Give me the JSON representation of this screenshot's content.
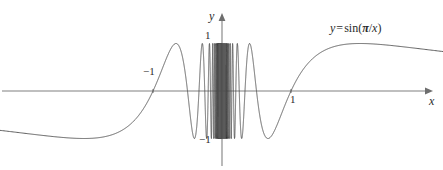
{
  "figure": {
    "title": "",
    "width": 443,
    "height": 170,
    "background_color": "#ffffff",
    "curve_color": "#4d4d4d",
    "axis_color": "#808080"
  },
  "axes": {
    "y_axis_label": "y",
    "x_axis_label": "x",
    "y_ticks": [
      {
        "value": 1,
        "label": "1"
      },
      {
        "value": -1,
        "label": "−1"
      }
    ],
    "x_ticks": [
      {
        "value": -1,
        "label": "−1"
      },
      {
        "value": 1,
        "label": "1"
      }
    ],
    "x_range": [
      -3.22,
      3.2
    ],
    "y_range": [
      -1.66,
      1.9
    ],
    "grid": false,
    "origin_px": {
      "x": 222,
      "y": 91
    },
    "scale_px_per_unit": {
      "x": 69,
      "y": 47.5
    }
  },
  "annotations": {
    "equation": {
      "lhs": "y",
      "equals": "=",
      "fn": "sin(",
      "pi": "π",
      "slash": "/",
      "arg": "x",
      "close": ")",
      "full_text": "y = sin(π/x)"
    }
  },
  "chart_data": {
    "type": "line",
    "title": "",
    "xlabel": "x",
    "ylabel": "y",
    "xlim": [
      -3.22,
      3.2
    ],
    "ylim": [
      -1.66,
      1.9
    ],
    "grid": false,
    "legend": "y = sin(π/x)",
    "legend_position": "upper-right",
    "function": "y = sin(pi/x)",
    "series": [
      {
        "name": "y = sin(π/x)",
        "expression": "sin(pi/x)",
        "color": "#4d4d4d",
        "notes": "Oscillates infinitely fast near x = 0; zeros at x = 1/n for integer n; approaches 0 as |x| grows large; local extrema of magnitude 1 at x = 2/(2k+1)."
      }
    ],
    "key_points": [
      {
        "x": -1,
        "y": 0,
        "label": "−1"
      },
      {
        "x": 1,
        "y": 0,
        "label": "1"
      },
      {
        "x": 2,
        "y": 1,
        "label": ""
      },
      {
        "x": -2,
        "y": -1,
        "label": ""
      },
      {
        "x": 0.6667,
        "y": -1,
        "label": ""
      },
      {
        "x": -0.6667,
        "y": 1,
        "label": ""
      },
      {
        "x": 0.4,
        "y": 1,
        "label": ""
      },
      {
        "x": 0.2857,
        "y": -1,
        "label": ""
      }
    ],
    "y_tick_values": [
      -1,
      1
    ],
    "x_tick_values": [
      -1,
      1
    ]
  }
}
